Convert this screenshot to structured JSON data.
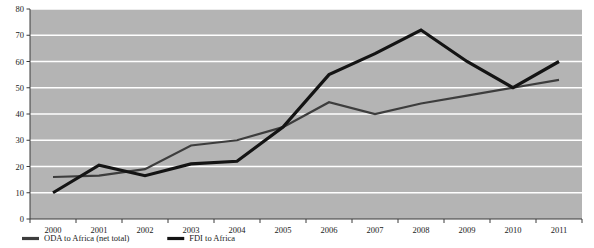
{
  "chart_data": {
    "type": "line",
    "title": "",
    "subtitle": "",
    "xlabel": "",
    "ylabel": "",
    "categories": [
      "2000",
      "2001",
      "2002",
      "2003",
      "2004",
      "2005",
      "2006",
      "2007",
      "2008",
      "2009",
      "2010",
      "2011"
    ],
    "x": [
      2000,
      2001,
      2002,
      2003,
      2004,
      2005,
      2006,
      2007,
      2008,
      2009,
      2010,
      2011
    ],
    "series": [
      {
        "name": "ODA to Africa (net total)",
        "color": "#3d3d3d",
        "line_width": 2.2,
        "values": [
          16,
          16.5,
          19,
          28,
          30,
          35,
          44.5,
          40,
          44,
          47,
          50,
          53
        ]
      },
      {
        "name": "FDI to Africa",
        "color": "#141414",
        "line_width": 3.2,
        "values": [
          10,
          20.5,
          16.5,
          21,
          22,
          35,
          55,
          63,
          72,
          60,
          50,
          60
        ]
      }
    ],
    "ylim": [
      0,
      80
    ],
    "ytick_values": [
      0,
      10,
      20,
      30,
      40,
      50,
      60,
      70,
      80
    ],
    "ytick_labels": [
      "0",
      "10",
      "20",
      "30",
      "40",
      "50",
      "60",
      "70",
      "80"
    ],
    "xtick_labels": [
      "2000",
      "2001",
      "2002",
      "2003",
      "2004",
      "2005",
      "2006",
      "2007",
      "2008",
      "2009",
      "2010",
      "2011"
    ],
    "grid": "horizontal",
    "grid_color": "#ffffff",
    "plot_background": "#b4b4b4",
    "figure_background": "#ffffff",
    "legend_position": "below-axis-left",
    "legend": [
      {
        "label": "ODA to Africa (net total)",
        "color": "#3d3d3d"
      },
      {
        "label": "FDI to Africa",
        "color": "#141414"
      }
    ]
  }
}
